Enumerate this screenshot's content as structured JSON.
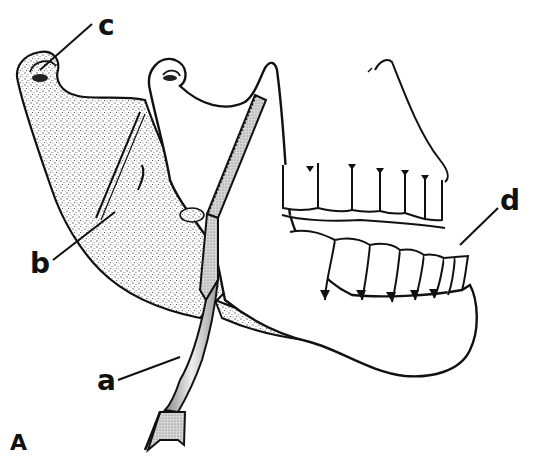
{
  "figure": {
    "panel_label": "A",
    "labels": [
      {
        "id": "a",
        "text": "a",
        "points_to": "saw handle / instrument"
      },
      {
        "id": "b",
        "text": "b",
        "points_to": "cut line across stippled ramus segment"
      },
      {
        "id": "c",
        "text": "c",
        "points_to": "condyle of stippled (posterior) segment"
      },
      {
        "id": "d",
        "text": "d",
        "points_to": "lower anterior teeth"
      }
    ],
    "colors": {
      "ink": "#111111",
      "stipple": "#8a8a8a",
      "background": "#ffffff",
      "blade_fill": "#bdbdbd"
    }
  }
}
